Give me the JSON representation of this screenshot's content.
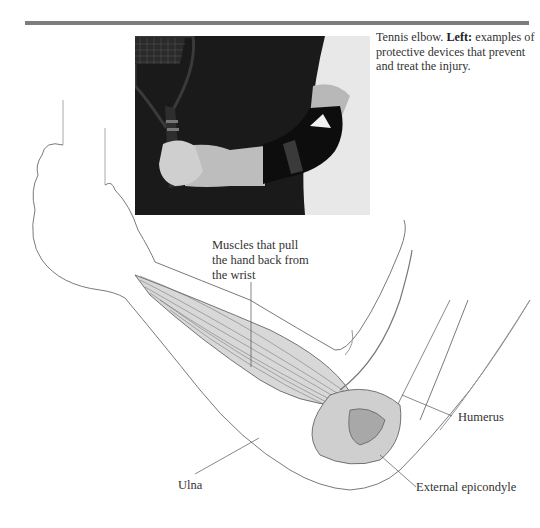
{
  "header": {
    "rule_color": "#7d7d7d"
  },
  "caption": {
    "lead": "Tennis elbow.",
    "bold": "Left:",
    "rest": "examples of protective devices that prevent and treat the injury."
  },
  "photo": {
    "description": "Arm holding tennis racket wearing black elbow support strap",
    "background_color": "#1c1c1c"
  },
  "labels": {
    "muscles_line1": "Muscles that pull",
    "muscles_line2": "the hand back from",
    "muscles_line3": "the wrist",
    "humerus": "Humerus",
    "ulna": "Ulna",
    "external_epicondyle": "External epicondyle"
  }
}
